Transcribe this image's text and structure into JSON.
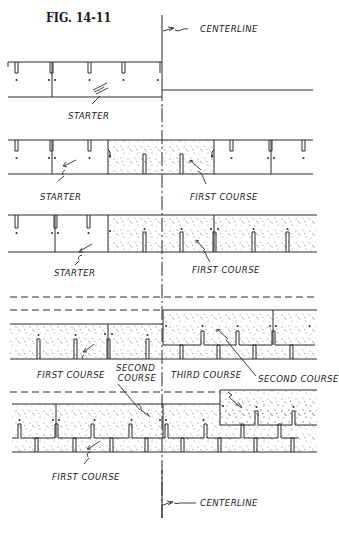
{
  "figure": {
    "title": "FIG. 14-11",
    "colors": {
      "line": "#2a2a2a",
      "background": "#ffffff",
      "speckle": "#7a7a7a"
    }
  },
  "labels": {
    "centerline_top": "CENTERLINE",
    "centerline_bottom": "CENTERLINE",
    "step1": {
      "starter": "STARTER"
    },
    "step2": {
      "starter": "STARTER",
      "first_course": "FIRST COURSE"
    },
    "step3": {
      "starter": "STARTER",
      "first_course": "FIRST COURSE"
    },
    "step4": {
      "first_course": "FIRST COURSE",
      "second_course_left_line1": "SECOND",
      "second_course_left_line2": "COURSE",
      "third_course": "THIRD COURSE",
      "second_course_right": "SECOND COURSE"
    },
    "step5": {
      "first_course": "FIRST COURSE"
    }
  },
  "steps": [
    {
      "id": 1,
      "shows": [
        "starter"
      ]
    },
    {
      "id": 2,
      "shows": [
        "starter",
        "first course (one shingle at centerline)"
      ]
    },
    {
      "id": 3,
      "shows": [
        "starter",
        "first course (extended right)"
      ]
    },
    {
      "id": 4,
      "shows": [
        "first course",
        "second course",
        "third course"
      ]
    },
    {
      "id": 5,
      "shows": [
        "first course",
        "second course",
        "third course (stepped)"
      ]
    }
  ]
}
